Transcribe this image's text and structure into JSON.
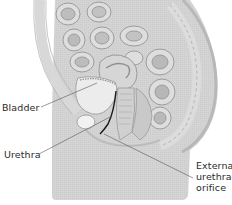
{
  "diagram": {
    "type": "anatomical-illustration",
    "colors": {
      "background": "#ffffff",
      "tissue_light": "#e6e6e6",
      "tissue_mid": "#cfcfcf",
      "tissue_dark": "#a9a9a9",
      "outline": "#9a9a9a",
      "urethra_line": "#1a1a1a",
      "leader_line": "#555555",
      "label_text": "#2a2a2a"
    },
    "labels": [
      {
        "id": "bladder",
        "text": "Bladder"
      },
      {
        "id": "urethra",
        "text": "Urethra"
      },
      {
        "id": "external-urethral-orifice",
        "lines": [
          "External",
          "urethral",
          "orifice"
        ]
      }
    ]
  }
}
